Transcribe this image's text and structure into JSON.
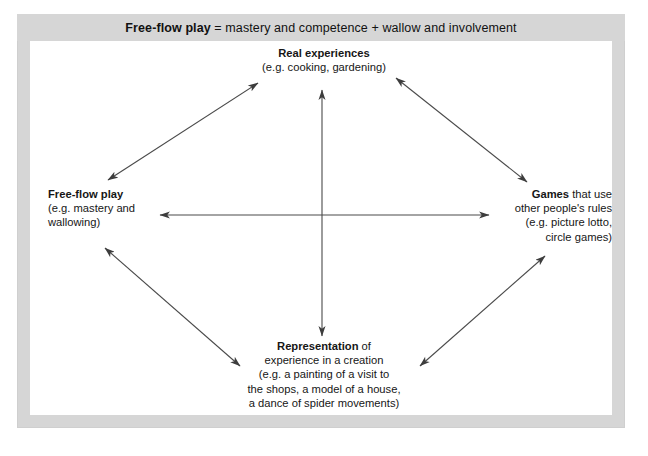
{
  "figure": {
    "header": {
      "bold_lead": "Free-flow play",
      "rest": " = mastery and competence + wallow and involvement",
      "full": "Free-flow play = mastery and competence + wallow and involvement"
    },
    "frame_color": "#d6d6d6",
    "canvas_color": "#ffffff",
    "line_color": "#4a4a4a"
  },
  "nodes": {
    "top": {
      "name": "Real experiences",
      "lines": [
        "Real experiences",
        "(e.g. cooking, gardening)"
      ]
    },
    "left": {
      "name": "Free-flow play",
      "lines": [
        "Free-flow play",
        "(e.g. mastery and",
        "wallowing)"
      ]
    },
    "right": {
      "name": "Games that use other people's rules",
      "lines": [
        "Games that use",
        "other people's rules",
        "(e.g. picture lotto,",
        "circle games)"
      ]
    },
    "bottom": {
      "name": "Representation of experience in a creation",
      "lines": [
        "Representation of",
        "experience in a creation",
        "(e.g. a painting of a visit to",
        "the shops, a model of a house,",
        "a dance of spider movements)"
      ]
    }
  },
  "connectors": [
    {
      "id": "top-left",
      "label": "Real experiences ↔ Free-flow play",
      "x1": 258,
      "y1": 83,
      "x2": 108,
      "y2": 180
    },
    {
      "id": "top-right",
      "label": "Real experiences ↔ Games",
      "x1": 396,
      "y1": 78,
      "x2": 527,
      "y2": 182
    },
    {
      "id": "bottom-left",
      "label": "Free-flow play ↔ Representation",
      "x1": 105,
      "y1": 248,
      "x2": 240,
      "y2": 366
    },
    {
      "id": "bottom-right",
      "label": "Representation ↔ Games",
      "x1": 420,
      "y1": 366,
      "x2": 545,
      "y2": 256
    },
    {
      "id": "horizontal",
      "label": "Free-flow play ↔ Games",
      "x1": 158,
      "y1": 215,
      "x2": 491,
      "y2": 215
    },
    {
      "id": "vertical",
      "label": "Real experiences ↔ Representation",
      "x1": 322,
      "y1": 88,
      "x2": 322,
      "y2": 338
    }
  ]
}
